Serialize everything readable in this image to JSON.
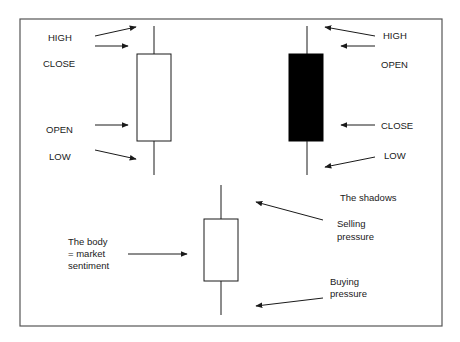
{
  "diagram": {
    "bullish_candle": {
      "labels": {
        "high": "HIGH",
        "close": "CLOSE",
        "open": "OPEN",
        "low": "LOW"
      },
      "body_color": "#ffffff"
    },
    "bearish_candle": {
      "labels": {
        "high": "HIGH",
        "open": "OPEN",
        "close": "CLOSE",
        "low": "LOW"
      },
      "body_color": "#000000"
    },
    "anatomy_candle": {
      "body_label_line1": "The body",
      "body_label_line2": "= market",
      "body_label_line3": "sentiment",
      "shadows_label": "The shadows",
      "upper_label_line1": "Selling",
      "upper_label_line2": "pressure",
      "lower_label_line1": "Buying",
      "lower_label_line2": "pressure"
    },
    "colors": {
      "line": "#1a1a1a",
      "frame": "#555555",
      "background": "#ffffff"
    }
  }
}
